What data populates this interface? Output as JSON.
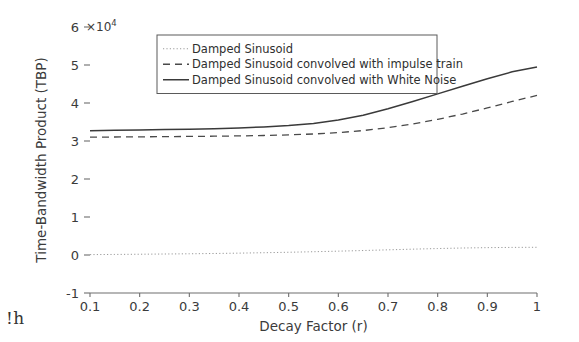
{
  "chart_data": {
    "type": "line",
    "title": "",
    "xlabel": "Decay Factor (r)",
    "ylabel": "Time-Bandwidth Product (TBP)",
    "y_offset_text": "×10",
    "y_offset_exponent": "4",
    "y_scale_multiplier": 10000,
    "xlim": [
      0.1,
      1.0
    ],
    "ylim": [
      -1,
      6
    ],
    "xticks": [
      0.1,
      0.2,
      0.3,
      0.4,
      0.5,
      0.6,
      0.7,
      0.8,
      0.9,
      1
    ],
    "xtick_labels": [
      "0.1",
      "0.2",
      "0.3",
      "0.4",
      "0.5",
      "0.6",
      "0.7",
      "0.8",
      "0.9",
      "1"
    ],
    "yticks": [
      -1,
      0,
      1,
      2,
      3,
      4,
      5,
      6
    ],
    "ytick_labels": [
      "-1",
      "0",
      "1",
      "2",
      "3",
      "4",
      "5",
      "6"
    ],
    "grid": false,
    "legend_position": "upper center",
    "x": [
      0.1,
      0.15,
      0.2,
      0.25,
      0.3,
      0.35,
      0.4,
      0.45,
      0.5,
      0.55,
      0.6,
      0.65,
      0.7,
      0.75,
      0.8,
      0.85,
      0.9,
      0.95,
      1.0
    ],
    "series": [
      {
        "name": "Damped Sinusoid",
        "style": "dotted",
        "color": "#9a9a9a",
        "width": 1.0,
        "values": [
          100,
          150,
          200,
          260,
          320,
          400,
          490,
          600,
          720,
          860,
          1010,
          1180,
          1360,
          1540,
          1700,
          1840,
          1940,
          2000,
          2030
        ]
      },
      {
        "name": "Damped Sinusoid convolved with impulse train",
        "style": "dashed",
        "color": "#4a4a4a",
        "width": 1.3,
        "values": [
          31000,
          31050,
          31100,
          31150,
          31200,
          31260,
          31340,
          31450,
          31600,
          31850,
          32200,
          32750,
          33500,
          34500,
          35700,
          37100,
          38700,
          40400,
          42000
        ]
      },
      {
        "name": "Damped Sinusoid convolved with White Noise",
        "style": "solid",
        "color": "#3a3a3a",
        "width": 1.5,
        "values": [
          32700,
          32800,
          32900,
          33000,
          33100,
          33250,
          33450,
          33700,
          34050,
          34600,
          35500,
          36800,
          38500,
          40400,
          42400,
          44400,
          46400,
          48200,
          49500
        ]
      }
    ]
  },
  "artifact": {
    "bottom_left_text": "!h"
  }
}
